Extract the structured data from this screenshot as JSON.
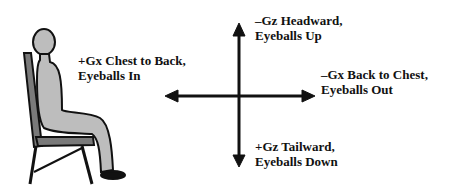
{
  "colors": {
    "figure_fill": "#bdbdbd",
    "chair_fill": "#7a7a7a",
    "stroke": "#111111"
  },
  "labels": {
    "plus_gx": {
      "line1": "+Gx  Chest to Back,",
      "line2": "Eyeballs In"
    },
    "minus_gz": {
      "line1": "–Gz  Headward,",
      "line2": "Eyeballs Up"
    },
    "minus_gx": {
      "line1": "–Gx  Back to Chest,",
      "line2": "Eyeballs Out"
    },
    "plus_gz": {
      "line1": "+Gz  Tailward,",
      "line2": "Eyeballs Down"
    }
  }
}
